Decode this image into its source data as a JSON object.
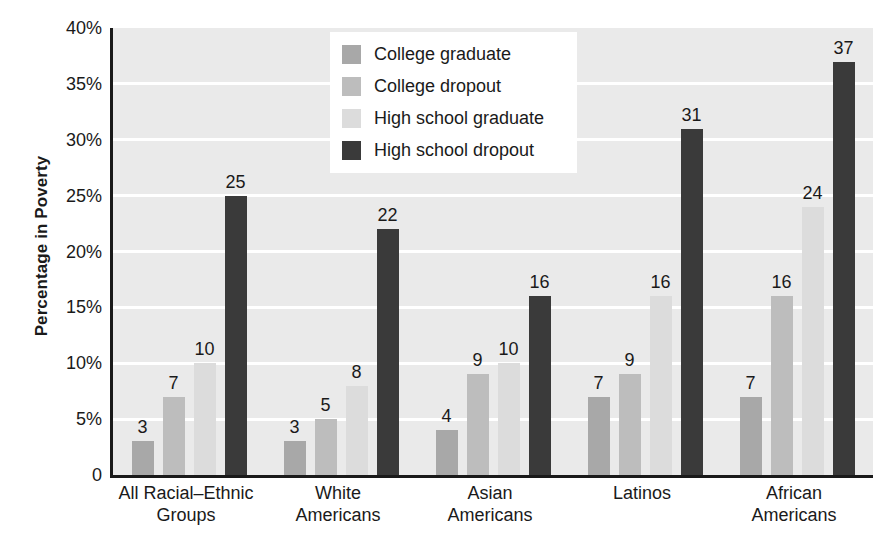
{
  "chart_data": {
    "type": "bar",
    "title": "",
    "xlabel": "",
    "ylabel": "Percentage in Poverty",
    "ylim": [
      0,
      40
    ],
    "ytick_labels": [
      "40%",
      "35%",
      "30%",
      "25%",
      "20%",
      "15%",
      "10%",
      "5%",
      "0"
    ],
    "ytick_values": [
      40,
      35,
      30,
      25,
      20,
      15,
      10,
      5,
      0
    ],
    "grid": "horizontal-white-gridlines",
    "legend_position": "top-center",
    "categories": [
      "All Racial–Ethnic Groups",
      "White Americans",
      "Asian Americans",
      "Latinos",
      "African Americans"
    ],
    "category_lines": [
      [
        "All Racial–Ethnic",
        "Groups"
      ],
      [
        "White",
        "Americans"
      ],
      [
        "Asian",
        "Americans"
      ],
      [
        "Latinos"
      ],
      [
        "African",
        "Americans"
      ]
    ],
    "series": [
      {
        "name": "College graduate",
        "color": "#a8a8a8",
        "values": [
          3,
          3,
          4,
          7,
          7
        ]
      },
      {
        "name": "College dropout",
        "color": "#bdbdbd",
        "values": [
          7,
          5,
          9,
          9,
          16
        ]
      },
      {
        "name": "High school graduate",
        "color": "#dcdcdc",
        "values": [
          10,
          8,
          10,
          16,
          24
        ]
      },
      {
        "name": "High school dropout",
        "color": "#3a3a3a",
        "values": [
          25,
          22,
          16,
          31,
          37
        ]
      }
    ],
    "value_labels": [
      [
        3,
        7,
        10,
        25
      ],
      [
        3,
        5,
        8,
        22
      ],
      [
        4,
        9,
        10,
        16
      ],
      [
        7,
        9,
        16,
        31
      ],
      [
        7,
        16,
        24,
        37
      ]
    ],
    "plot_background": "#eaeaea",
    "gridline_color": "#ffffff",
    "axis_color": "#1a1a1a",
    "page_background": "#ffffff"
  },
  "legend": {
    "items": [
      {
        "label": "College graduate",
        "color": "#a8a8a8"
      },
      {
        "label": "College dropout",
        "color": "#bdbdbd"
      },
      {
        "label": "High school graduate",
        "color": "#dcdcdc"
      },
      {
        "label": "High school dropout",
        "color": "#3a3a3a"
      }
    ]
  }
}
